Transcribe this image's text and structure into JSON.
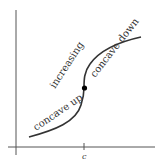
{
  "diagram": {
    "labels": {
      "increasing": "increasing",
      "concave_up": "concave up",
      "concave_down": "concave down",
      "x_tick": "c"
    },
    "colors": {
      "axes": "#555555",
      "curve": "#333333",
      "point": "#000000"
    }
  }
}
